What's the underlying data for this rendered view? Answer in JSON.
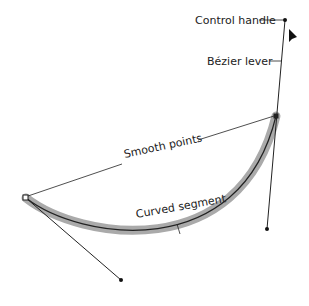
{
  "labels": {
    "control_handle": "Control handle",
    "bezier_lever": "Bézier lever",
    "smooth_points": "Smooth points",
    "curved_segment": "Curved segment"
  },
  "colors": {
    "line": "#222222",
    "highlight": "#a8a8a8",
    "background": "#ffffff"
  },
  "curve": {
    "start": [
      26,
      198
    ],
    "end": [
      276,
      116
    ],
    "control_start": [
      121,
      280
    ],
    "control_end": [
      267,
      229
    ],
    "control_end_opposite": [
      285,
      20
    ]
  }
}
